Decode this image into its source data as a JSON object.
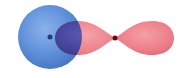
{
  "diagram": {
    "s_orbital": {
      "shape": "sphere",
      "center": [
        50,
        37
      ],
      "radius": 32,
      "color": "#5b8fd9",
      "highlight": "#86aee8",
      "shadow": "#3f70bf"
    },
    "s_nucleus": {
      "center": [
        50,
        37
      ],
      "radius": 2.5,
      "color": "#1f3f78"
    },
    "p_orbital": {
      "shape": "dumbbell",
      "center": [
        115,
        38
      ],
      "left_lobe_extent": 56,
      "right_lobe_extent": 174,
      "lobe_half_height": 17,
      "color": "#ee7c86",
      "highlight": "#f6a2a8",
      "shadow": "#d8616c"
    },
    "p_nucleus": {
      "center": [
        115,
        38
      ],
      "radius": 2.5,
      "color": "#5a0d14"
    },
    "overlap_region": {
      "color": "#4a4aa0"
    }
  }
}
